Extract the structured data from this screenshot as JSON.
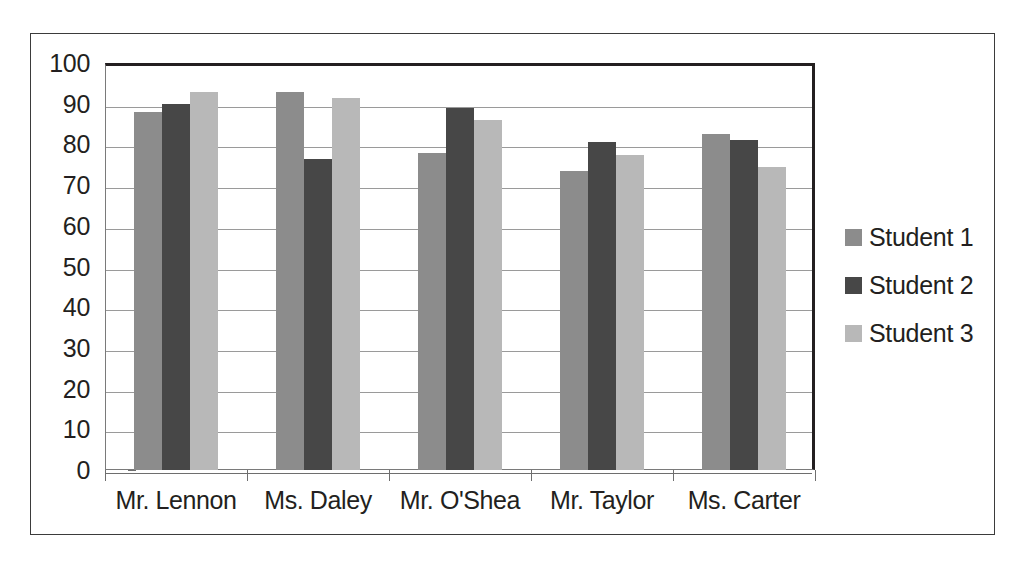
{
  "chart_data": {
    "type": "bar",
    "title": "",
    "xlabel": "",
    "ylabel": "",
    "ylim": [
      0,
      100
    ],
    "ytick_step": 10,
    "grid": true,
    "legend_position": "right",
    "categories": [
      "Mr. Lennon",
      "Ms. Daley",
      "Mr. O'Shea",
      "Mr. Taylor",
      "Ms. Carter"
    ],
    "ytick_labels": [
      "100",
      "90",
      "80",
      "70",
      "60",
      "50",
      "40",
      "30",
      "20",
      "10",
      "0"
    ],
    "series": [
      {
        "name": "Student 1",
        "color": "#8c8c8c",
        "values": [
          88,
          93,
          78,
          73.5,
          82.5
        ]
      },
      {
        "name": "Student 2",
        "color": "#474747",
        "values": [
          90,
          76.5,
          89,
          80.5,
          81
        ]
      },
      {
        "name": "Student 3",
        "color": "#b8b8b8",
        "values": [
          93,
          91.5,
          86,
          77.5,
          74.5
        ]
      }
    ]
  },
  "style": {
    "plot_border_color": "#231f20",
    "gridline_color": "#9a9a9a",
    "figure_border_color": "#3b3b3b",
    "background": "#ffffff"
  }
}
